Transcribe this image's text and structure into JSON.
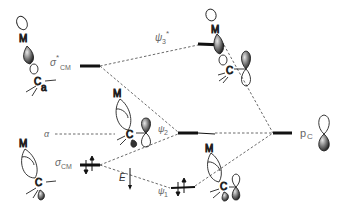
{
  "diagram": {
    "type": "molecular-orbital-diagram",
    "left_fragment": {
      "levels": [
        {
          "id": "sigma_star_cm",
          "label_main": "σ",
          "label_sup": "*",
          "label_sub": "CM",
          "occupied": false
        },
        {
          "id": "alpha",
          "label_main": "α",
          "occupied": false
        },
        {
          "id": "sigma_cm",
          "label_main": "σ",
          "label_sub": "CM",
          "occupied": true,
          "electrons": "↑↓"
        }
      ]
    },
    "molecular_orbitals": [
      {
        "id": "psi3_star",
        "label_main": "ψ",
        "label_sub": "3",
        "label_sup": "*",
        "occupied": false
      },
      {
        "id": "psi2",
        "label_main": "ψ",
        "label_sub": "2",
        "occupied": false
      },
      {
        "id": "psi1",
        "label_main": "ψ",
        "label_sub": "1",
        "occupied": true,
        "electrons": "↑↓"
      }
    ],
    "right_fragment": {
      "levels": [
        {
          "id": "p_c",
          "label_main": "p",
          "label_sub": "C",
          "occupied": false
        }
      ]
    },
    "energy_axis": {
      "label": "E"
    },
    "atoms": {
      "metal": "M",
      "carbon": "C",
      "metal_mark": "a",
      "carbon_mark": "a"
    }
  }
}
